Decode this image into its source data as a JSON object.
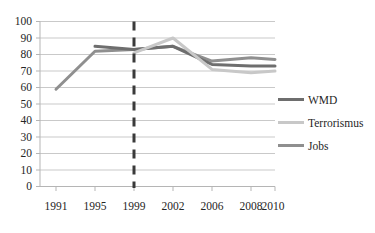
{
  "chart_data": {
    "type": "line",
    "title": "",
    "xlabel": "",
    "ylabel": "",
    "categories": [
      "1991",
      "1995",
      "1999",
      "2002",
      "2006",
      "2008",
      "2010"
    ],
    "x_tick_labels": [
      "1991",
      "1995",
      "1999",
      "2002",
      "2006",
      "2008",
      "2010"
    ],
    "y_tick_labels": [
      "100",
      "90",
      "80",
      "70",
      "60",
      "50",
      "40",
      "30",
      "20",
      "10",
      "0"
    ],
    "ylim": [
      0,
      100
    ],
    "ystep": 10,
    "grid": "horizontal",
    "legend_position": "right",
    "series": [
      {
        "name": "WMD",
        "color": "#6e6e6e",
        "values": [
          null,
          85,
          83,
          85,
          74,
          73,
          73
        ]
      },
      {
        "name": "Terrorismus",
        "color": "#c8c8c8",
        "values": [
          null,
          null,
          81,
          90,
          71,
          69,
          70
        ]
      },
      {
        "name": "Jobs",
        "color": "#8f8f8f",
        "values": [
          59,
          82,
          83,
          85,
          76,
          78,
          77
        ]
      }
    ],
    "annotations": [
      {
        "type": "vertical-dashed-line",
        "name": "reference-line",
        "x_position_between": [
          "1999",
          "2002"
        ],
        "color": "#3a3a3a"
      }
    ]
  },
  "legend": {
    "items": [
      {
        "label": "WMD",
        "color": "#6e6e6e"
      },
      {
        "label": "Terrorismus",
        "color": "#c8c8c8"
      },
      {
        "label": "Jobs",
        "color": "#8f8f8f"
      }
    ]
  },
  "axes": {
    "axis_color": "#bfbfbf",
    "grid_color": "#c9c9c9",
    "tick_text_color": "#252525"
  }
}
